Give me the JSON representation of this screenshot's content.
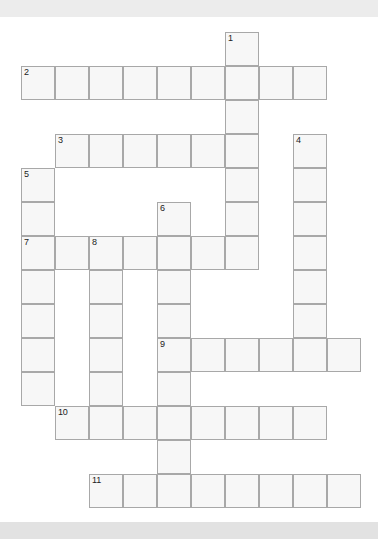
{
  "page": {
    "type": "crossword-puzzle-grid",
    "background_color": "#ffffff",
    "banner_color": "#ececec",
    "footer_color": "#e2e2e2",
    "cell_fill_color": "#f7f7f7",
    "cell_border_color": "#a8a8a8",
    "number_color": "#222222"
  },
  "grid": {
    "cell_size": 34,
    "origin_x": 21,
    "origin_y": 15,
    "columns": 10,
    "rows": 14
  },
  "entries": [
    {
      "number": "1",
      "direction": "down",
      "col": 6,
      "row": 0,
      "length": 7
    },
    {
      "number": "2",
      "direction": "across",
      "col": 0,
      "row": 1,
      "length": 9
    },
    {
      "number": "3",
      "direction": "across",
      "col": 1,
      "row": 3,
      "length": 6
    },
    {
      "number": "4",
      "direction": "down",
      "col": 8,
      "row": 3,
      "length": 7
    },
    {
      "number": "5",
      "direction": "down",
      "col": 0,
      "row": 4,
      "length": 7
    },
    {
      "number": "6",
      "direction": "down",
      "col": 4,
      "row": 5,
      "length": 9
    },
    {
      "number": "7",
      "direction": "across",
      "col": 0,
      "row": 6,
      "length": 7
    },
    {
      "number": "8",
      "direction": "down",
      "col": 2,
      "row": 6,
      "length": 6
    },
    {
      "number": "9",
      "direction": "across",
      "col": 4,
      "row": 9,
      "length": 6
    },
    {
      "number": "10",
      "direction": "across",
      "col": 1,
      "row": 11,
      "length": 8
    },
    {
      "number": "11",
      "direction": "across",
      "col": 2,
      "row": 13,
      "length": 8
    }
  ],
  "numbered_cells": [
    {
      "label": "1",
      "col": 6,
      "row": 0
    },
    {
      "label": "2",
      "col": 0,
      "row": 1
    },
    {
      "label": "3",
      "col": 1,
      "row": 3
    },
    {
      "label": "4",
      "col": 8,
      "row": 3
    },
    {
      "label": "5",
      "col": 0,
      "row": 4
    },
    {
      "label": "6",
      "col": 4,
      "row": 5
    },
    {
      "label": "7",
      "col": 0,
      "row": 6
    },
    {
      "label": "8",
      "col": 2,
      "row": 6
    },
    {
      "label": "9",
      "col": 4,
      "row": 9
    },
    {
      "label": "10",
      "col": 1,
      "row": 11
    },
    {
      "label": "11",
      "col": 2,
      "row": 13
    }
  ]
}
